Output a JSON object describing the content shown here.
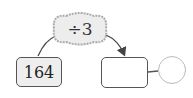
{
  "diagram": {
    "operation": "÷3",
    "start_value": "164",
    "result_value": "",
    "check_circle_value": ""
  },
  "colors": {
    "cloud_fill": "#ededed",
    "cloud_border": "#aaaaaa",
    "box_border": "#555555",
    "start_box_fill": "#eeeeee"
  }
}
